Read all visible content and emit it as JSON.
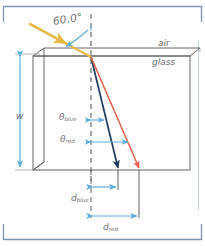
{
  "figure": {
    "labels": {
      "incident_angle": "60.0°",
      "medium_above": "air",
      "medium_below": "glass",
      "slab_thickness": "w",
      "theta_blue_symbol": "θ",
      "theta_blue_sub": "blue",
      "theta_red_symbol": "θ",
      "theta_red_sub": "red",
      "d_blue_symbol": "d",
      "d_blue_sub": "blue",
      "d_red_symbol": "d",
      "d_red_sub": "red"
    },
    "colors": {
      "frame_line": "#7a93b0",
      "incident_ray": "#e8b949",
      "blue_ray": "#1f3a5f",
      "red_ray": "#e4604a",
      "dimension_arrow": "#5aaedb",
      "slab_outline": "#4a4a4a",
      "text": "#6e6e72",
      "background": "#ffffff"
    }
  }
}
